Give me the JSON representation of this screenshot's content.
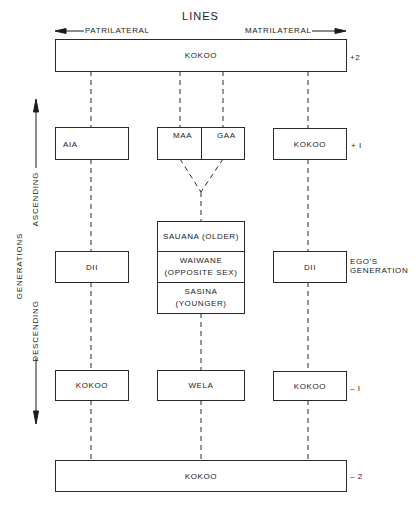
{
  "header": {
    "title": "LINES",
    "left_direction": "PATRILATERAL",
    "right_direction": "MATRILATERAL"
  },
  "axis": {
    "title": "GENERATIONS",
    "up_label": "ASCENDING",
    "down_label": "DESCENDING"
  },
  "rows": {
    "plus2": {
      "marker": "+2",
      "band": "KOKOO"
    },
    "plus1": {
      "marker": "+ I",
      "left": "AIA",
      "center_left": "MAA",
      "center_right": "GAA",
      "right": "KOKOO"
    },
    "ego": {
      "marker_line1": "EGO'S",
      "marker_line2": "GENERATION",
      "left": "DII",
      "center_top": "SAUANA (OLDER)",
      "center_mid_line1": "WAIWANE",
      "center_mid_line2": "(OPPOSITE SEX)",
      "center_bottom_line1": "SASINA",
      "center_bottom_line2": "(YOUNGER)",
      "right": "DII"
    },
    "minus1": {
      "marker": "– I",
      "left": "KOKOO",
      "center": "WELA",
      "right": "KOKOO"
    },
    "minus2": {
      "marker": "– 2",
      "band": "KOKOO"
    }
  },
  "colors": {
    "line": "#2a2a2a",
    "background": "#ffffff"
  }
}
